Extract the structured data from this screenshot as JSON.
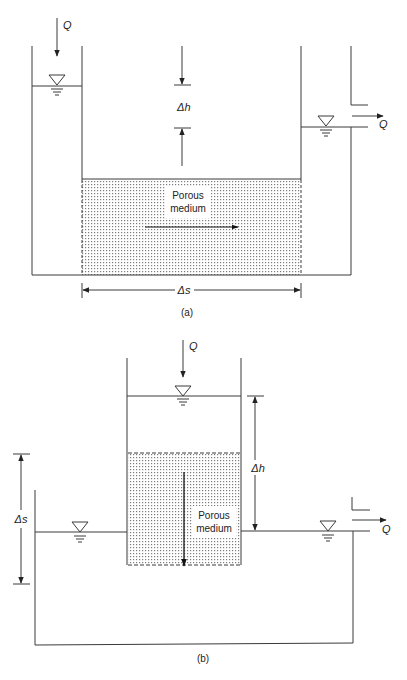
{
  "figure_a": {
    "caption": "(a)",
    "inflow_label": "Q",
    "outflow_label": "Q",
    "head_diff_label": "Δh",
    "length_label": "Δs",
    "medium_label_line1": "Porous",
    "medium_label_line2": "medium",
    "flow_direction": "horizontal"
  },
  "figure_b": {
    "caption": "(b)",
    "inflow_label": "Q",
    "outflow_label": "Q",
    "head_diff_label": "Δh",
    "length_label": "Δs",
    "medium_label_line1": "Porous",
    "medium_label_line2": "medium",
    "flow_direction": "vertical-down"
  },
  "colors": {
    "line": "#3a3a3a",
    "dot": "#8a8a8a",
    "background": "#ffffff"
  }
}
